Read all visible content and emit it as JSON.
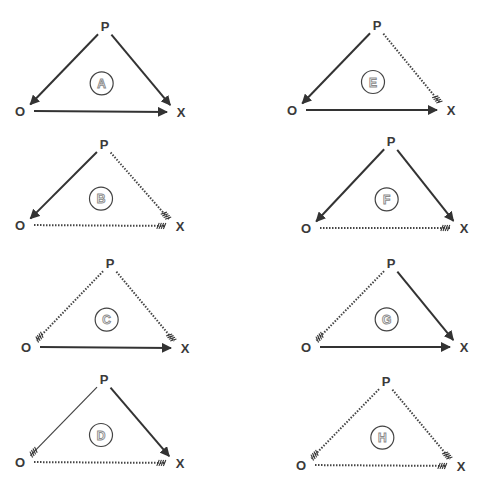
{
  "diagram": {
    "type": "triad-balance",
    "vertex_labels": {
      "top": "P",
      "left": "O",
      "right": "X"
    },
    "edge_styles": {
      "solid": "solid line with filled arrowhead",
      "thin": "thin solid line with hatched tip",
      "dotted": "dotted line with hatched tip"
    },
    "colors": {
      "line": "#333333",
      "text": "#3a3a3a",
      "panel_label_outline": "#8a8a8a"
    },
    "panels": [
      {
        "id": "A",
        "label": "A",
        "P": [
          105,
          27
        ],
        "O": [
          24,
          111
        ],
        "X": [
          176,
          112
        ],
        "edges": {
          "PO": "solid",
          "PX": "solid",
          "OX": "solid"
        }
      },
      {
        "id": "B",
        "label": "B",
        "P": [
          104,
          145
        ],
        "O": [
          24,
          225
        ],
        "X": [
          175,
          226
        ],
        "edges": {
          "PO": "solid",
          "PX": "dotted",
          "OX": "dotted"
        }
      },
      {
        "id": "C",
        "label": "C",
        "P": [
          110,
          264
        ],
        "O": [
          30,
          347
        ],
        "X": [
          180,
          348
        ],
        "edges": {
          "PO": "dotted",
          "PX": "dotted",
          "OX": "solid"
        }
      },
      {
        "id": "D",
        "label": "D",
        "P": [
          104,
          380
        ],
        "O": [
          24,
          462
        ],
        "X": [
          175,
          463
        ],
        "edges": {
          "PO": "thin",
          "PX": "solid",
          "OX": "dotted"
        }
      },
      {
        "id": "E",
        "label": "E",
        "P": [
          377,
          26
        ],
        "O": [
          296,
          110
        ],
        "X": [
          446,
          110
        ],
        "edges": {
          "PO": "solid",
          "PX": "dotted",
          "OX": "solid"
        }
      },
      {
        "id": "F",
        "label": "F",
        "P": [
          391,
          142
        ],
        "O": [
          310,
          228
        ],
        "X": [
          459,
          228
        ],
        "edges": {
          "PO": "solid",
          "PX": "solid",
          "OX": "dotted"
        }
      },
      {
        "id": "G",
        "label": "G",
        "P": [
          391,
          264
        ],
        "O": [
          310,
          347
        ],
        "X": [
          459,
          347
        ],
        "edges": {
          "PO": "dotted",
          "PX": "solid",
          "OX": "solid"
        }
      },
      {
        "id": "H",
        "label": "H",
        "P": [
          386,
          382
        ],
        "O": [
          305,
          465
        ],
        "X": [
          456,
          466
        ],
        "edges": {
          "PO": "dotted",
          "PX": "dotted",
          "OX": "dotted"
        }
      }
    ]
  }
}
